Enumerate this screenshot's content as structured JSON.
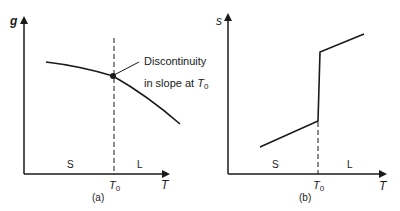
{
  "panels": [
    {
      "id": "a",
      "caption": "(a)",
      "y_label": "g",
      "x_label": "T",
      "x_marker": "T",
      "x_marker_sub": "0",
      "region_left": "S",
      "region_right": "L",
      "annotation_line1": "Discontinuity",
      "annotation_line2": "in slope at ",
      "annotation_sym": "T",
      "annotation_sub": "0"
    },
    {
      "id": "b",
      "caption": "(b)",
      "y_label": "s",
      "x_label": "T",
      "x_marker": "T",
      "x_marker_sub": "0",
      "region_left": "S",
      "region_right": "L"
    }
  ],
  "colors": {
    "ink": "#1a1a1a",
    "background": "#ffffff"
  }
}
